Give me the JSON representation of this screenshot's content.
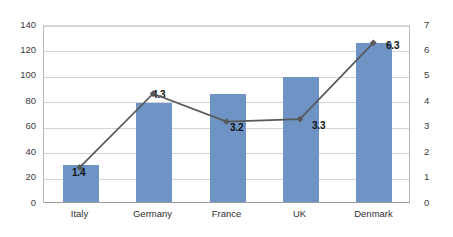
{
  "chart_data": {
    "type": "bar",
    "title": "",
    "subtitle": "",
    "xlabel": "",
    "ylabel": "",
    "grid": true,
    "legend": "none",
    "categories": [
      "Italy",
      "Germany",
      "France",
      "UK",
      "Denmark"
    ],
    "series": [
      {
        "name": "bars",
        "type": "bar",
        "axis": "left",
        "color": "#6e94c6",
        "values": [
          29,
          78,
          85,
          98,
          125
        ],
        "data_labels": false
      },
      {
        "name": "line",
        "type": "line",
        "axis": "right",
        "color": "#595959",
        "values": [
          1.4,
          4.3,
          3.2,
          3.3,
          6.3
        ],
        "data_labels": true,
        "labels": [
          "1.4",
          "4.3",
          "3.2",
          "3.3",
          "6.3"
        ]
      }
    ],
    "axes": {
      "left": {
        "min": 0,
        "max": 140,
        "step": 20,
        "ticks": [
          "0",
          "20",
          "40",
          "60",
          "80",
          "100",
          "120",
          "140"
        ]
      },
      "right": {
        "min": 0,
        "max": 7,
        "step": 1,
        "ticks": [
          "0",
          "1",
          "2",
          "3",
          "4",
          "5",
          "6",
          "7"
        ]
      }
    },
    "colors": {
      "bar": "#6e94c6",
      "line": "#595959",
      "grid": "#d4d4d4",
      "axis": "#9a9a9a",
      "text": "#2f2f2f"
    }
  }
}
